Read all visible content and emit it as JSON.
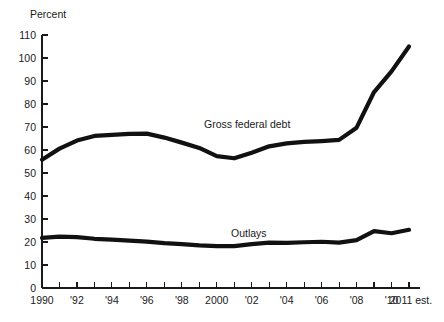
{
  "chart_data": {
    "type": "line",
    "title": "",
    "subtitle": "",
    "xlabel": "",
    "ylabel": "Percent",
    "ylim": [
      0,
      110
    ],
    "xlim": [
      1990,
      2011
    ],
    "grid": false,
    "legend_position": "inline-annotation",
    "y_ticks": [
      0,
      10,
      20,
      30,
      40,
      50,
      60,
      70,
      80,
      90,
      100,
      110
    ],
    "y_tick_labels": [
      "0",
      "10",
      "20",
      "30",
      "40",
      "50",
      "60",
      "70",
      "80",
      "90",
      "100",
      "110"
    ],
    "x": [
      1990,
      1991,
      1992,
      1993,
      1994,
      1995,
      1996,
      1997,
      1998,
      1999,
      2000,
      2001,
      2002,
      2003,
      2004,
      2005,
      2006,
      2007,
      2008,
      2009,
      2010,
      2011
    ],
    "x_tick_labels": [
      "1990",
      "",
      "'92",
      "",
      "'94",
      "",
      "'96",
      "",
      "'98",
      "",
      "2000",
      "",
      "'02",
      "",
      "'04",
      "",
      "'06",
      "",
      "'08",
      "",
      "'10",
      "2011 est."
    ],
    "x_major_labels": [
      "1990",
      "'92",
      "'94",
      "'96",
      "'98",
      "2000",
      "'02",
      "'04",
      "'06",
      "'08",
      "'10",
      "2011 est."
    ],
    "series": [
      {
        "name": "Gross federal debt",
        "annotation": "Gross federal debt",
        "color": "#111111",
        "stroke_width": 4.2,
        "values": [
          55.8,
          60.6,
          64.1,
          66.1,
          66.6,
          67.0,
          67.1,
          65.4,
          63.2,
          60.9,
          57.3,
          56.4,
          58.8,
          61.6,
          62.9,
          63.5,
          63.9,
          64.4,
          69.7,
          85.2,
          94.2,
          105.0
        ]
      },
      {
        "name": "Outlays",
        "annotation": "Outlays",
        "color": "#111111",
        "stroke_width": 4.2,
        "values": [
          21.8,
          22.3,
          22.1,
          21.4,
          21.0,
          20.6,
          20.2,
          19.5,
          19.1,
          18.5,
          18.2,
          18.2,
          19.1,
          19.7,
          19.6,
          19.9,
          20.1,
          19.7,
          20.8,
          24.7,
          23.8,
          25.3
        ]
      }
    ]
  },
  "labels": {
    "y_axis_unit": "Percent"
  }
}
